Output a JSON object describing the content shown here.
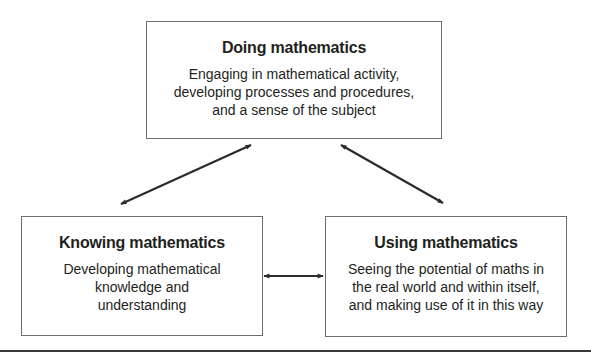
{
  "diagram": {
    "nodes": [
      {
        "id": "doing",
        "title": "Doing mathematics",
        "description_lines": [
          "Engaging in mathematical activity,",
          "developing processes and procedures,",
          "and a sense of the subject"
        ]
      },
      {
        "id": "knowing",
        "title": "Knowing mathematics",
        "description_lines": [
          "Developing mathematical",
          "knowledge and",
          "understanding"
        ]
      },
      {
        "id": "using",
        "title": "Using mathematics",
        "description_lines": [
          "Seeing the potential of maths in",
          "the real world and within itself,",
          "and making use of it in this way"
        ]
      }
    ],
    "edges": [
      {
        "from": "doing",
        "to": "knowing",
        "type": "bidirectional"
      },
      {
        "from": "doing",
        "to": "using",
        "type": "bidirectional"
      },
      {
        "from": "knowing",
        "to": "using",
        "type": "bidirectional"
      }
    ],
    "colors": {
      "arrow": "#2b2b2b",
      "border": "#6d6d6d",
      "text": "#231f20"
    }
  }
}
